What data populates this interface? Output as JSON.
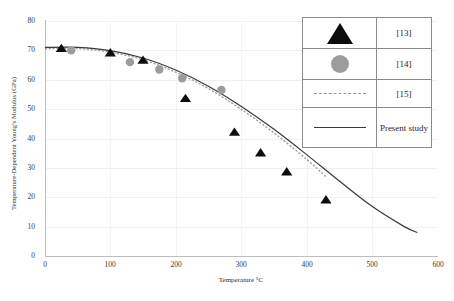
{
  "chart_data": {
    "type": "line",
    "title": "",
    "xlabel": "Temperature °C",
    "ylabel": "Temperature-Dependent Young's Modulus (GPa)",
    "xlim": [
      0,
      600
    ],
    "ylim": [
      0,
      80
    ],
    "xticks": [
      0,
      100,
      200,
      300,
      400,
      500,
      600
    ],
    "yticks": [
      0,
      10,
      20,
      30,
      40,
      50,
      60,
      70,
      80
    ],
    "grid": true,
    "legend_position": "top-right",
    "series": [
      {
        "name": "[13]",
        "marker": "triangle",
        "color": "#0d0d0d",
        "style": "markers",
        "x": [
          25,
          100,
          150,
          215,
          290,
          330,
          370,
          430
        ],
        "y": [
          70.5,
          69.0,
          66.5,
          53.5,
          42.0,
          35.0,
          28.5,
          19.0
        ]
      },
      {
        "name": "[14]",
        "marker": "circle",
        "color": "#9c9c9c",
        "style": "markers",
        "x": [
          40,
          130,
          175,
          210,
          270
        ],
        "y": [
          70.0,
          66.0,
          63.5,
          60.5,
          56.5
        ]
      },
      {
        "name": "[15]",
        "marker": "none",
        "color": "#9a9a9a",
        "style": "dashed-line",
        "x": [
          0,
          50,
          100,
          150,
          200,
          250,
          300,
          350,
          400,
          430
        ],
        "y": [
          70.6,
          70.6,
          69.4,
          66.8,
          62.6,
          57.0,
          50.0,
          42.0,
          33.0,
          27.0
        ]
      },
      {
        "name": "Present study",
        "marker": "none",
        "color": "#3a3a3a",
        "style": "solid-line",
        "x": [
          0,
          50,
          100,
          150,
          200,
          250,
          300,
          350,
          400,
          450,
          500,
          550,
          570
        ],
        "y": [
          71.0,
          71.0,
          69.9,
          67.4,
          63.3,
          57.8,
          51.0,
          43.2,
          34.6,
          25.6,
          17.0,
          10.0,
          8.0
        ]
      }
    ]
  },
  "axes": {
    "y_tick_labels": [
      "80",
      "70",
      "60",
      "50",
      "40",
      "30",
      "20",
      "10",
      "0"
    ],
    "x_tick_labels": [
      "0",
      "100",
      "200",
      "300",
      "400",
      "500",
      "600"
    ],
    "y_title": "Temperature-Dependent Young's Modulus (GPa)",
    "x_title": "Temperature °C"
  },
  "legend": {
    "rows": [
      {
        "symbol": "triangle-marker",
        "label": "[13]"
      },
      {
        "symbol": "circle-marker",
        "label": "[14]"
      },
      {
        "symbol": "dashed-line",
        "label": "[15]"
      },
      {
        "symbol": "solid-line",
        "label": "Present study"
      }
    ]
  },
  "colors": {
    "triangle": "#0d0d0d",
    "circle": "#9c9c9c",
    "dashed": "#9a9a9a",
    "solid": "#3a3a3a",
    "axis": "#bdbdbd",
    "grid": "#f0f0f0",
    "background": "#ffffff"
  }
}
